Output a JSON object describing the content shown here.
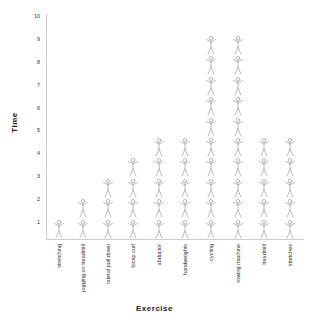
{
  "chart_data": {
    "type": "bar",
    "subtype": "pictograph",
    "title": "",
    "xlabel": "Exercise",
    "ylabel": "Time",
    "ylim": [
      0,
      10
    ],
    "yticks": [
      1,
      2,
      3,
      4,
      5,
      6,
      7,
      8,
      9,
      10
    ],
    "grid": false,
    "icon": "stick-figure-arms-raised",
    "icon_color": "#aaaaaa",
    "categories": [
      "stretching",
      "jogging on treadmill",
      "lateral pull down",
      "bicep curl",
      "abductor",
      "handweights",
      "cycling",
      "rowing machine",
      "treadmill",
      "stretches"
    ],
    "values": [
      1,
      2,
      3,
      4,
      5,
      5,
      10,
      10,
      5,
      5
    ]
  }
}
